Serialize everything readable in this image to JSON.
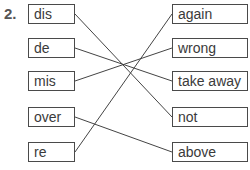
{
  "exercise": {
    "number": "2.",
    "left_items": [
      "dis",
      "de",
      "mis",
      "over",
      "re"
    ],
    "right_items": [
      "again",
      "wrong",
      "take away",
      "not",
      "above"
    ],
    "matches": [
      {
        "left": "dis",
        "right": "not"
      },
      {
        "left": "de",
        "right": "take away"
      },
      {
        "left": "mis",
        "right": "wrong"
      },
      {
        "left": "over",
        "right": "above"
      },
      {
        "left": "re",
        "right": "again"
      }
    ]
  }
}
